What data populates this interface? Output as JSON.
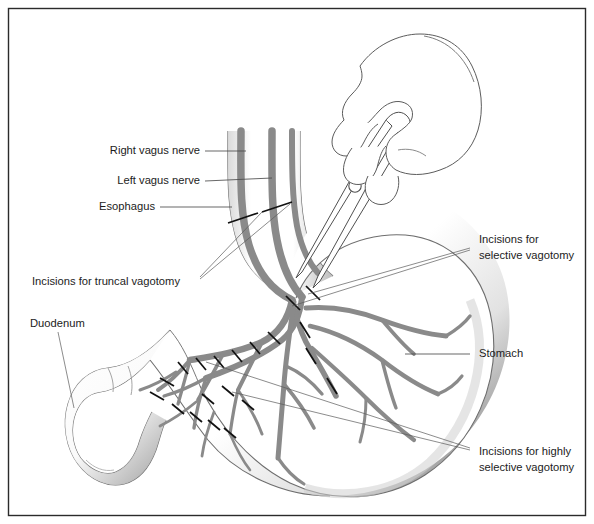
{
  "figure": {
    "background_color": "#ffffff",
    "frame_color": "#2b2b2b",
    "nerve_color": "#8a8a8a",
    "incision_color": "#111111",
    "leader_color": "#4b4b4b",
    "text_color": "#1c1c1c"
  },
  "labels": {
    "right_vagus_nerve": "Right vagus nerve",
    "left_vagus_nerve": "Left vagus nerve",
    "esophagus": "Esophagus",
    "incisions_truncal": "Incisions for truncal vagotomy",
    "duodenum": "Duodenum",
    "incisions_selective_line1": "Incisions for",
    "incisions_selective_line2": "selective vagotomy",
    "stomach": "Stomach",
    "incisions_highly_selective_line1": "Incisions for highly",
    "incisions_highly_selective_line2": "selective vagotomy"
  },
  "anatomy": {
    "structures": [
      "esophagus",
      "stomach",
      "duodenum",
      "anterior vagal trunk",
      "posterior vagal trunk",
      "gastric nerve branches"
    ],
    "instrument": "surgical scissors held in hand"
  }
}
